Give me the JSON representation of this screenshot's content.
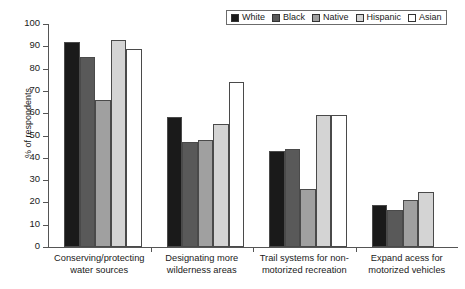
{
  "chart_data": {
    "type": "bar",
    "title": "",
    "xlabel": "",
    "ylabel": "% of respondents",
    "ylim": [
      0,
      100
    ],
    "ytick_step": 10,
    "yticks": [
      100,
      90,
      80,
      70,
      60,
      50,
      40,
      30,
      20,
      10,
      0
    ],
    "grid": false,
    "legend_position": "top-right",
    "categories": [
      "Conserving/protecting water sources",
      "Designating more wilderness areas",
      "Trail systems for non-motorized recreation",
      "Expand acess for motorized vehicles"
    ],
    "category_lines": [
      [
        "Conserving/protecting",
        "water sources"
      ],
      [
        "Designating more",
        "wilderness areas"
      ],
      [
        "Trail systems for non-",
        "motorized recreation"
      ],
      [
        "Expand acess for",
        "motorized vehicles"
      ]
    ],
    "series": [
      {
        "name": "White",
        "color": "#1a1a1a",
        "values": [
          92,
          58.5,
          43,
          19
        ]
      },
      {
        "name": "Black",
        "color": "#595959",
        "values": [
          85,
          47,
          44,
          16.5
        ]
      },
      {
        "name": "Native",
        "color": "#a0a0a0",
        "values": [
          66,
          48,
          26,
          21
        ]
      },
      {
        "name": "Hispanic",
        "color": "#d4d4d4",
        "values": [
          93,
          55,
          59,
          24.5
        ]
      },
      {
        "name": "Asian",
        "color": "#ffffff",
        "values": [
          89,
          74,
          59,
          null
        ]
      }
    ]
  }
}
